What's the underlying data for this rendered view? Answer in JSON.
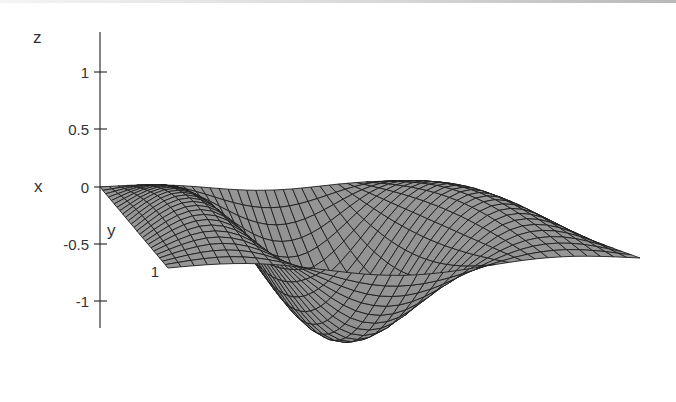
{
  "chart_data": {
    "type": "surface3d",
    "title": "",
    "function_description": "z = sin(2*pi*x) * sin(pi*y) style wave surface over unit square, shown in oblique 3D projection",
    "axes": {
      "z": {
        "label": "z",
        "ticks": [
          "1",
          "0.5",
          "0",
          "-0.5",
          "-1"
        ],
        "zlim": [
          -1,
          1
        ]
      },
      "x": {
        "label": "x"
      },
      "y": {
        "label": "y",
        "tick_labels": [
          "1"
        ]
      }
    },
    "features": {
      "peaks": [
        {
          "position": "back-left",
          "z": 1
        },
        {
          "position": "back-right",
          "z": 1
        }
      ],
      "trough": {
        "position": "front-center",
        "z": -1
      },
      "grid": true,
      "shading": "flat gray with dark mesh lines"
    },
    "surface_color": "#9a9a9a",
    "mesh_color": "#1e1e1e"
  },
  "labels": {
    "z_axis": "z",
    "x_axis": "x",
    "y_axis": "y",
    "y_tick": "1",
    "z_ticks": [
      "1",
      "0.5",
      "0",
      "-0.5",
      "-1"
    ]
  }
}
